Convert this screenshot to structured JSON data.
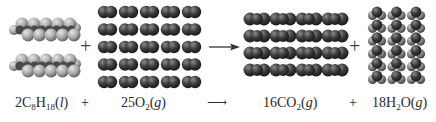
{
  "reactants": [
    {
      "id": "octane",
      "coefficient": "2",
      "formula_parts": [
        [
          "C",
          ""
        ],
        [
          "8",
          "sub"
        ],
        [
          "H",
          ""
        ],
        [
          "18",
          "sub"
        ]
      ],
      "state": "l",
      "molecule_count": 2,
      "visual": "space-filling chain molecules (light gray)"
    },
    {
      "id": "oxygen",
      "coefficient": "25",
      "formula_parts": [
        [
          "O",
          ""
        ],
        [
          "2",
          "sub"
        ]
      ],
      "state": "g",
      "molecule_count": 25,
      "grid": {
        "cols": 5,
        "rows": 5
      },
      "visual": "diatomic dark gray molecules"
    }
  ],
  "products": [
    {
      "id": "carbon-dioxide",
      "coefficient": "16",
      "formula_parts": [
        [
          "CO",
          ""
        ],
        [
          "2",
          "sub"
        ]
      ],
      "state": "g",
      "molecule_count": 16,
      "grid": {
        "cols": 4,
        "rows": 4
      },
      "visual": "triatomic linear dark molecules"
    },
    {
      "id": "water",
      "coefficient": "18",
      "formula_parts": [
        [
          "H",
          ""
        ],
        [
          "2",
          "sub"
        ],
        [
          "O",
          ""
        ]
      ],
      "state": "g",
      "molecule_count": 18,
      "grid": {
        "cols": 3,
        "rows": 6
      },
      "visual": "bent molecules, dark O with light H"
    }
  ],
  "symbols": {
    "plus": "+",
    "arrow": "⟶"
  },
  "equation": {
    "octane": {
      "coef": "2",
      "f1": "C",
      "s1": "8",
      "f2": "H",
      "s2": "18",
      "open": "(",
      "state": "l",
      "close": ")"
    },
    "oxygen": {
      "coef": "25",
      "f1": "O",
      "s1": "2",
      "open": "(",
      "state": "g",
      "close": ")"
    },
    "co2": {
      "coef": "16",
      "f1": "CO",
      "s1": "2",
      "open": "(",
      "state": "g",
      "close": ")"
    },
    "water": {
      "coef": "18",
      "f1": "H",
      "s1": "2",
      "f2": "O",
      "open": "(",
      "state": "g",
      "close": ")"
    }
  },
  "colors": {
    "carbon_light": "#9a9a9a",
    "oxygen_dark": "#3a3a3a",
    "hydrogen_light": "#b0b0b0",
    "text": "#2a2a2a"
  }
}
